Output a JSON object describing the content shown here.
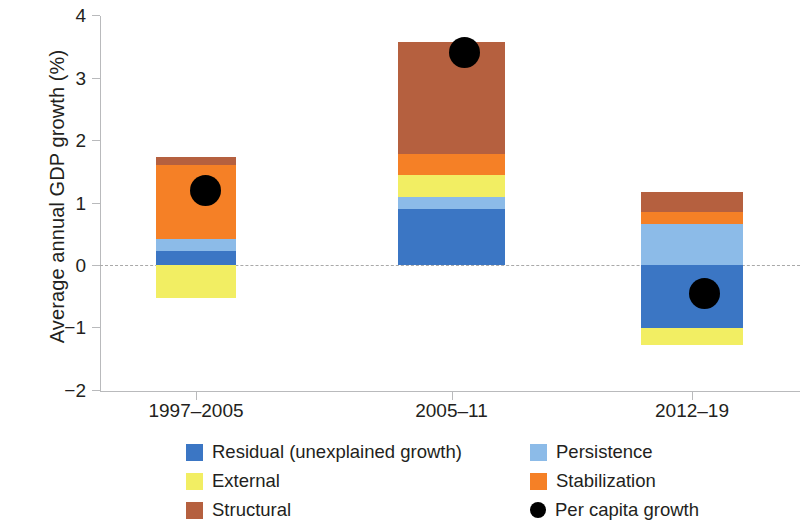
{
  "chart_data": {
    "type": "bar",
    "stacked": true,
    "title": "",
    "xlabel": "",
    "ylabel": "Average annual GDP growth (%)",
    "ylim": [
      -2,
      4
    ],
    "yticks": [
      "4",
      "3",
      "2",
      "1",
      "0",
      "-1",
      "-2"
    ],
    "ytick_values": [
      4,
      3,
      2,
      1,
      0,
      -1,
      -2
    ],
    "grid": false,
    "zero_line": true,
    "legend_position": "bottom",
    "categories": [
      "1997–2005",
      "2005–11",
      "2012–19"
    ],
    "series": [
      {
        "name": "Residual (unexplained growth)",
        "color": "#3b76c4",
        "values": [
          0.23,
          0.9,
          -1.01
        ]
      },
      {
        "name": "Persistence",
        "color": "#8cbbe8",
        "values": [
          0.19,
          0.19,
          0.66
        ]
      },
      {
        "name": "External",
        "color": "#f2ee63",
        "values": [
          -0.53,
          0.35,
          -0.27
        ]
      },
      {
        "name": "Stabilization",
        "color": "#f58026",
        "values": [
          1.18,
          0.34,
          0.19
        ]
      },
      {
        "name": "Structural",
        "color": "#b5603f",
        "values": [
          0.13,
          1.79,
          0.32
        ]
      }
    ],
    "markers": {
      "name": "Per capita growth",
      "color": "#000000",
      "values": [
        1.2,
        3.4,
        -0.45
      ]
    },
    "bar_totals": [
      1.72,
      3.43,
      1.17
    ]
  },
  "axis": {
    "y_title": "Average annual GDP growth (%)",
    "y_tick_labels": [
      "4",
      "3",
      "2",
      "1",
      "0",
      "−1",
      "−2"
    ],
    "x_tick_labels": [
      "1997–2005",
      "2005–11",
      "2012–19"
    ]
  },
  "legend": {
    "items": [
      {
        "label": "Residual (unexplained growth)",
        "color": "#3b76c4",
        "shape": "square"
      },
      {
        "label": "Persistence",
        "color": "#8cbbe8",
        "shape": "square"
      },
      {
        "label": "External",
        "color": "#f2ee63",
        "shape": "square"
      },
      {
        "label": "Stabilization",
        "color": "#f58026",
        "shape": "square"
      },
      {
        "label": "Structural",
        "color": "#b5603f",
        "shape": "square"
      },
      {
        "label": "Per capita growth",
        "color": "#000000",
        "shape": "circle"
      }
    ]
  }
}
